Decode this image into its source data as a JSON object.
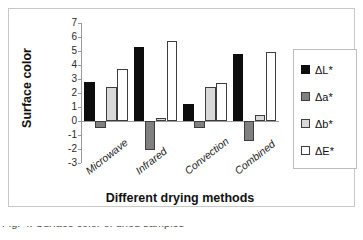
{
  "chart_data": {
    "type": "bar",
    "title": "",
    "xlabel": "Different drying methods",
    "ylabel": "Surface color",
    "categories": [
      "Microwave",
      "Infrared",
      "Convection",
      "Combined"
    ],
    "series": [
      {
        "name": "ΔL*",
        "color": "#0d0d0d",
        "values": [
          2.8,
          5.3,
          1.2,
          4.8
        ]
      },
      {
        "name": "Δa*",
        "color": "#808080",
        "values": [
          -0.5,
          -2.1,
          -0.5,
          -1.4
        ]
      },
      {
        "name": "Δb*",
        "color": "#d9d9d9",
        "values": [
          2.4,
          0.25,
          2.4,
          0.4
        ]
      },
      {
        "name": "ΔE*",
        "color": "#ffffff",
        "values": [
          3.7,
          5.7,
          2.7,
          4.9
        ]
      }
    ],
    "ylim": [
      -3,
      7
    ],
    "ytick_labels": [
      "7",
      "6",
      "5",
      "4",
      "3",
      "2",
      "1",
      "0",
      "-1",
      "-2",
      "-3"
    ],
    "ytick_values": [
      7,
      6,
      5,
      4,
      3,
      2,
      1,
      0,
      -1,
      -2,
      -3
    ],
    "grid": false,
    "legend_position": "right",
    "legend_entries": [
      "ΔL*",
      "Δa*",
      "Δb*",
      "ΔE*"
    ]
  },
  "caption": {
    "text": "Fig. 4. Surface color of dried samples"
  }
}
